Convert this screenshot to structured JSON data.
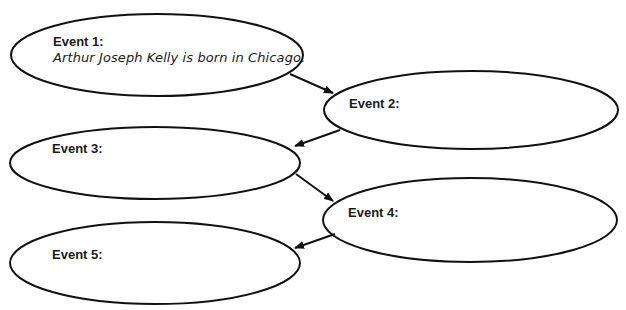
{
  "diagram": {
    "type": "sequence-of-events",
    "events": [
      {
        "label": "Event 1:",
        "text": "Arthur Joseph Kelly is born in Chicago."
      },
      {
        "label": "Event 2:",
        "text": ""
      },
      {
        "label": "Event 3:",
        "text": ""
      },
      {
        "label": "Event 4:",
        "text": ""
      },
      {
        "label": "Event 5:",
        "text": ""
      }
    ],
    "arrows": [
      {
        "from": 1,
        "to": 2
      },
      {
        "from": 2,
        "to": 3
      },
      {
        "from": 3,
        "to": 4
      },
      {
        "from": 4,
        "to": 5
      }
    ],
    "colors": {
      "stroke": "#111111",
      "fill": "#ffffff",
      "text": "#1a1a1a"
    }
  }
}
